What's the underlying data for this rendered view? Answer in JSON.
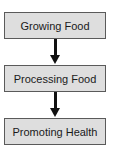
{
  "diagram": {
    "type": "flowchart",
    "direction": "top-to-bottom",
    "nodes": [
      {
        "id": "growing",
        "label": "Growing Food"
      },
      {
        "id": "processing",
        "label": "Processing Food"
      },
      {
        "id": "promoting",
        "label": "Promoting Health"
      }
    ],
    "edges": [
      {
        "from": "growing",
        "to": "processing"
      },
      {
        "from": "processing",
        "to": "promoting"
      }
    ],
    "colors": {
      "box_fill": "#dedede",
      "box_border": "#5a5a5a",
      "arrow": "#111111"
    }
  }
}
